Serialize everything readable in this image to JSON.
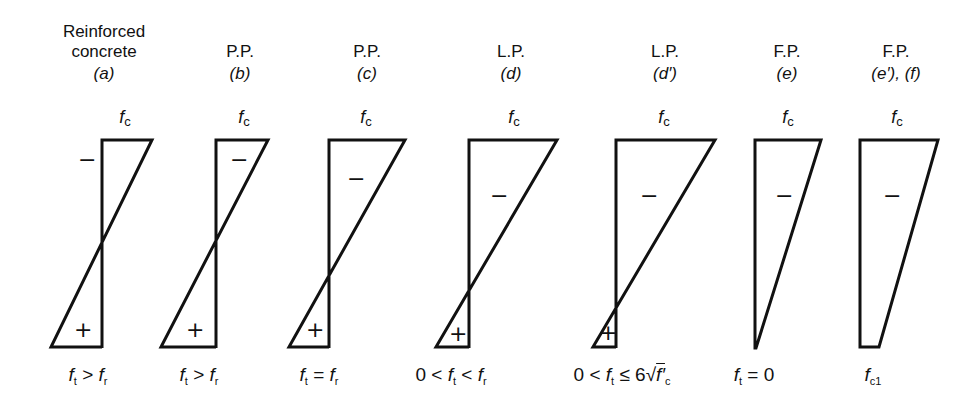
{
  "figure": {
    "columns": [
      {
        "id": "a",
        "type_line1": "Reinforced",
        "type_line2": "concrete",
        "case": "(a)",
        "top_label": "f",
        "top_sub": "c",
        "condition": "f_t > f_r",
        "cond_parts": [
          "f",
          "t",
          " > ",
          "f",
          "r"
        ],
        "signs": [
          "−",
          "+"
        ]
      },
      {
        "id": "b",
        "type_line1": "",
        "type_line2": "P.P.",
        "case": "(b)",
        "top_label": "f",
        "top_sub": "c",
        "condition": "f_t > f_r",
        "cond_parts": [
          "f",
          "t",
          " > ",
          "f",
          "r"
        ],
        "signs": [
          "−",
          "+"
        ]
      },
      {
        "id": "c",
        "type_line1": "",
        "type_line2": "P.P.",
        "case": "(c)",
        "top_label": "f",
        "top_sub": "c",
        "condition": "f_t = f_r",
        "cond_parts": [
          "f",
          "t",
          " = ",
          "f",
          "r"
        ],
        "signs": [
          "−",
          "+"
        ]
      },
      {
        "id": "d",
        "type_line1": "",
        "type_line2": "L.P.",
        "case": "(d)",
        "top_label": "f",
        "top_sub": "c",
        "condition": "0 < f_t < f_r",
        "cond_prefix": "0 < ",
        "cond_parts": [
          "f",
          "t",
          " < ",
          "f",
          "r"
        ],
        "signs": [
          "−",
          "+"
        ]
      },
      {
        "id": "d_prime",
        "type_line1": "",
        "type_line2": "L.P.",
        "case": "(d′)",
        "top_label": "f",
        "top_sub": "c",
        "condition": "0 < f_t ≤ 6√f'c",
        "cond_prefix": "0 < ",
        "cond_parts": [
          "f",
          "t",
          " ≤ 6√",
          "f′",
          "c"
        ],
        "signs": [
          "−",
          "+"
        ]
      },
      {
        "id": "e",
        "type_line1": "",
        "type_line2": "F.P.",
        "case": "(e)",
        "top_label": "f",
        "top_sub": "c",
        "condition": "f_t = 0",
        "cond_parts": [
          "f",
          "t",
          " = 0"
        ],
        "signs": [
          "−"
        ]
      },
      {
        "id": "e_prime_f",
        "type_line1": "",
        "type_line2": "F.P.",
        "case": "(e′), (f)",
        "top_label": "f",
        "top_sub": "c",
        "condition": "f_c1",
        "cond_parts": [
          "f",
          "c1"
        ],
        "signs": [
          "−"
        ]
      }
    ]
  },
  "colors": {
    "stroke": "#111111",
    "background": "#ffffff"
  }
}
